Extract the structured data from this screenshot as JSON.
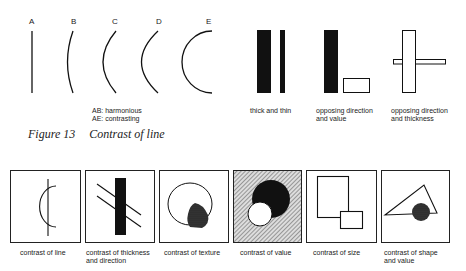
{
  "top": {
    "letters": [
      "A",
      "B",
      "C",
      "D",
      "E"
    ],
    "legend": {
      "line1": "AB: harmonious",
      "line2": "AE: contrasting"
    },
    "examples": [
      {
        "line1": "thick and thin",
        "line2": ""
      },
      {
        "line1": "opposing direction",
        "line2": "and value"
      },
      {
        "line1": "opposing direction",
        "line2": "and thickness"
      }
    ]
  },
  "figure_caption": {
    "number": "Figure 13",
    "title": "Contrast of line"
  },
  "bottom": {
    "panels": [
      {
        "line1": "contrast of line",
        "line2": ""
      },
      {
        "line1": "contrast of thickness",
        "line2": "and direction"
      },
      {
        "line1": "contrast of texture",
        "line2": ""
      },
      {
        "line1": "contrast of value",
        "line2": ""
      },
      {
        "line1": "contrast of size",
        "line2": ""
      },
      {
        "line1": "contrast of shape",
        "line2": "and value"
      }
    ]
  },
  "colors": {
    "ink": "#111111",
    "paper": "#ffffff",
    "hatch": "#777777"
  }
}
